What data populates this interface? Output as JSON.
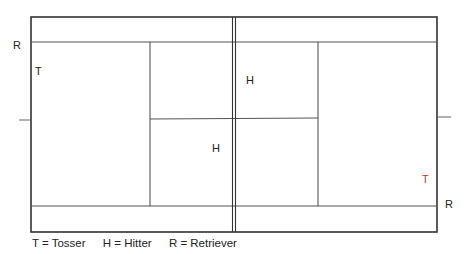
{
  "diagram": {
    "players": [
      {
        "code": "R",
        "role": "Retriever",
        "side": "left",
        "color": "#222222"
      },
      {
        "code": "T",
        "role": "Tosser",
        "side": "left",
        "color": "#222222"
      },
      {
        "code": "H",
        "role": "Hitter",
        "side": "right",
        "color": "#222222"
      },
      {
        "code": "H",
        "role": "Hitter",
        "side": "left",
        "color": "#222222"
      },
      {
        "code": "T",
        "role": "Tosser",
        "side": "right",
        "color": "#c8342b"
      },
      {
        "code": "R",
        "role": "Retriever",
        "side": "right",
        "color": "#222222"
      }
    ],
    "legend": [
      {
        "text": "T = Tosser"
      },
      {
        "text": "H = Hitter"
      },
      {
        "text": "R = Retriever"
      }
    ]
  }
}
